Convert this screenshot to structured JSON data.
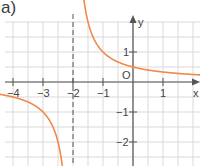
{
  "panel_label": "a)",
  "chart_data": {
    "type": "line",
    "title": "a)",
    "function": "y = 1/(x+2)",
    "xlabel": "x",
    "ylabel": "y",
    "xlim": [
      -4.3,
      2.2
    ],
    "ylim": [
      -2.8,
      2.0
    ],
    "grid": true,
    "grid_step": 0.5,
    "x_ticks": [
      "-4",
      "-3",
      "-2",
      "-1",
      "1"
    ],
    "y_ticks": [
      "1",
      "-1",
      "-2"
    ],
    "origin_label": "O",
    "asymptote": {
      "type": "vertical",
      "x": -2,
      "style": "dashed"
    },
    "series": [
      {
        "name": "left-branch",
        "x": [
          -4.3,
          -4,
          -3.5,
          -3,
          -2.5,
          -2.3
        ],
        "y": [
          -0.43,
          -0.5,
          -0.67,
          -1,
          -2,
          -3.33
        ]
      },
      {
        "name": "right-branch",
        "x": [
          -1.5,
          -1,
          -0.5,
          0,
          0.5,
          1,
          1.5,
          2.2
        ],
        "y": [
          2,
          1,
          0.67,
          0.5,
          0.4,
          0.33,
          0.29,
          0.24
        ]
      }
    ],
    "curve_color": "#f08a4b"
  }
}
